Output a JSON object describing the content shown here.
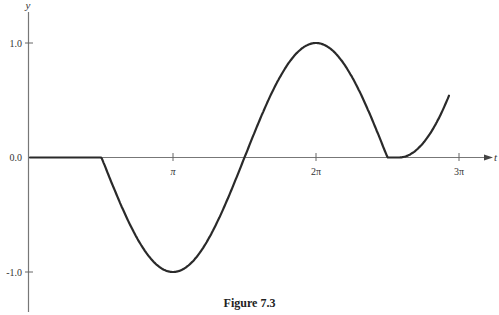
{
  "chart_data": {
    "type": "line",
    "title": "",
    "caption": "Figure 7.3",
    "xlabel": "t",
    "ylabel": "y",
    "x_ticks": [
      {
        "value": 3.14159,
        "label": "π"
      },
      {
        "value": 6.28319,
        "label": "2π"
      },
      {
        "value": 9.42478,
        "label": "3π"
      }
    ],
    "y_ticks": [
      {
        "value": 1.0,
        "label": "1.0"
      },
      {
        "value": 0.0,
        "label": "0.0"
      },
      {
        "value": -1.0,
        "label": "-1.0"
      }
    ],
    "xlim": [
      0,
      9.9
    ],
    "ylim": [
      -1.25,
      1.2
    ],
    "grid": false,
    "legend": null,
    "series": [
      {
        "name": "y(t)",
        "description": "0 for t<π/2; cos(t) for π/2≤t≤5π/2; then ~0 briefly and rising",
        "x": [
          0,
          1.5708,
          1.9635,
          2.3562,
          2.7489,
          3.1416,
          3.5343,
          3.927,
          4.3197,
          4.7124,
          5.1051,
          5.4978,
          5.8905,
          6.2832,
          6.6759,
          7.0686,
          7.4613,
          7.854,
          8.08,
          8.3,
          8.6,
          8.9,
          9.2
        ],
        "y": [
          0,
          0,
          -0.383,
          -0.707,
          -0.924,
          -1.0,
          -0.924,
          -0.707,
          -0.383,
          0,
          0.383,
          0.707,
          0.924,
          1.0,
          0.924,
          0.707,
          0.383,
          0,
          0,
          0.02,
          0.12,
          0.3,
          0.54
        ]
      }
    ]
  },
  "figure": {
    "caption": "Figure 7.3",
    "x_axis_label": "t",
    "y_axis_label": "y",
    "x_tick_labels": [
      "π",
      "2π",
      "3π"
    ],
    "y_tick_labels": [
      "1.0",
      "0.0",
      "-1.0"
    ]
  }
}
